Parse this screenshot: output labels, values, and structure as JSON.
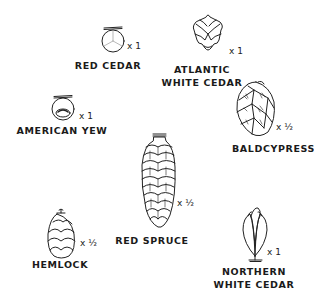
{
  "specimens": [
    {
      "id": "red-cedar",
      "label_lines": [
        "RED CEDAR"
      ],
      "scale": "x 1"
    },
    {
      "id": "atlantic-white-cedar",
      "label_lines": [
        "ATLANTIC",
        "WHITE CEDAR"
      ],
      "scale": "x 1"
    },
    {
      "id": "american-yew",
      "label_lines": [
        "AMERICAN YEW"
      ],
      "scale": "x 1"
    },
    {
      "id": "baldcypress",
      "label_lines": [
        "BALDCYPRESS"
      ],
      "scale": "x ½"
    },
    {
      "id": "red-spruce",
      "label_lines": [
        "RED SPRUCE"
      ],
      "scale": "x ½"
    },
    {
      "id": "hemlock",
      "label_lines": [
        "HEMLOCK"
      ],
      "scale": "x ½"
    },
    {
      "id": "northern-white-cedar",
      "label_lines": [
        "NORTHERN",
        "WHITE CEDAR"
      ],
      "scale": "x 1"
    }
  ],
  "colors": {
    "ink": "#1a1a1a",
    "background": "#ffffff"
  }
}
